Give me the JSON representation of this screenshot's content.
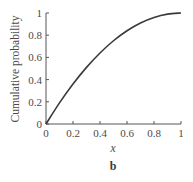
{
  "chart_data": {
    "type": "line",
    "title": "",
    "panel_label": "b",
    "xlabel": "x",
    "ylabel": "Cumulative probability",
    "xlim": [
      0,
      1
    ],
    "ylim": [
      0,
      1
    ],
    "grid": false,
    "legend": null,
    "x_ticks": [
      "0",
      "0.2",
      "0.4",
      "0.6",
      "0.8",
      "1"
    ],
    "y_ticks": [
      "0",
      "0.2",
      "0.4",
      "0.6",
      "0.8",
      "1"
    ],
    "series": [
      {
        "name": "Cumulative probability",
        "x": [
          0,
          0.1,
          0.2,
          0.3,
          0.4,
          0.5,
          0.6,
          0.7,
          0.8,
          0.9,
          1.0
        ],
        "values": [
          0,
          0.19,
          0.36,
          0.51,
          0.64,
          0.75,
          0.84,
          0.91,
          0.96,
          0.99,
          1.0
        ]
      }
    ],
    "line_color": "#3a3a3a"
  }
}
